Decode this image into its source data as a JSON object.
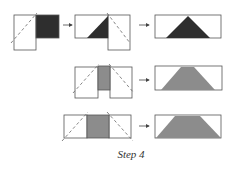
{
  "caption": "Step 4",
  "colors": {
    "dark_fill": "#2e2e2e",
    "gray_fill": "#8c8c8c",
    "outline": "#555555",
    "paper": "#ffffff"
  },
  "rows": [
    {
      "name": "row-1",
      "description": "Fold corner over dark square to form triangle"
    },
    {
      "name": "row-2",
      "description": "Fold both sides over narrow gray strip to form trapezoid"
    },
    {
      "name": "row-3",
      "description": "Fold both sides over wide gray strip to form wide trapezoid"
    }
  ]
}
